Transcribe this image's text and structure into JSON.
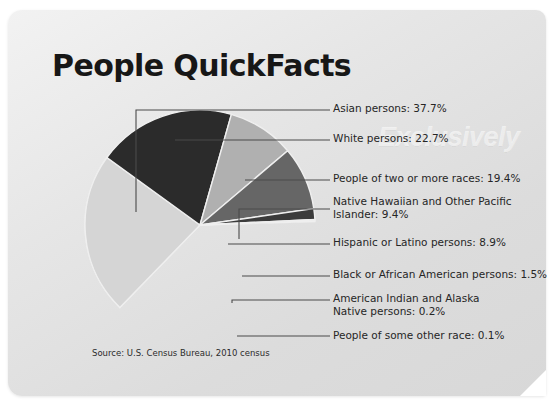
{
  "title": "People QuickFacts",
  "watermark": "Exclusively",
  "source": "Source: U.S. Census Bureau, 2010 census",
  "colors": {
    "card_light": "#f2f2f2",
    "card_dark": "#d8d8d8",
    "page_background": "#ffffff",
    "title_text": "#171717",
    "label_text": "#262626",
    "leader_line": "#4a4a4a"
  },
  "chart_data": {
    "type": "pie",
    "title": "People QuickFacts",
    "xlabel": "",
    "ylabel": "",
    "legend_position": "right",
    "grid": false,
    "units": "percent",
    "categories": [
      "Asian persons",
      "White persons",
      "People of two or more races",
      "Native Hawaiian and Other Pacific Islander",
      "Hispanic or Latino persons",
      "Black or African American persons",
      "American Indian and Alaska Native persons",
      "People of some other race"
    ],
    "values": [
      37.7,
      22.7,
      19.4,
      9.4,
      8.9,
      1.5,
      0.2,
      0.1
    ],
    "slice_colors": [
      "#9b9b9b",
      "#d5d5d5",
      "#2b2b2b",
      "#b0b0b0",
      "#666666",
      "#3b3b3b",
      "#cfcfcf",
      "#8a8a8a"
    ],
    "slices": [
      {
        "label": "Asian persons",
        "value": 37.7,
        "display": "Asian persons: 37.7%",
        "color": "#9b9b9b"
      },
      {
        "label": "White persons",
        "value": 22.7,
        "display": "White persons: 22.7%",
        "color": "#d5d5d5"
      },
      {
        "label": "People of two or more races",
        "value": 19.4,
        "display": "People of two or more races: 19.4%",
        "color": "#2b2b2b"
      },
      {
        "label": "Native Hawaiian and Other Pacific Islander",
        "value": 9.4,
        "display": "Native Hawaiian and Other Pacific\nIslander: 9.4%",
        "color": "#b0b0b0"
      },
      {
        "label": "Hispanic or Latino persons",
        "value": 8.9,
        "display": "Hispanic or Latino persons: 8.9%",
        "color": "#666666"
      },
      {
        "label": "Black or African American persons",
        "value": 1.5,
        "display": "Black or African American persons: 1.5%",
        "color": "#3b3b3b"
      },
      {
        "label": "American Indian and Alaska Native persons",
        "value": 0.2,
        "display": "American Indian and Alaska\nNative persons: 0.2%",
        "color": "#cfcfcf"
      },
      {
        "label": "People of some other race",
        "value": 0.1,
        "display": "People of some other race: 0.1%",
        "color": "#8a8a8a"
      }
    ]
  }
}
